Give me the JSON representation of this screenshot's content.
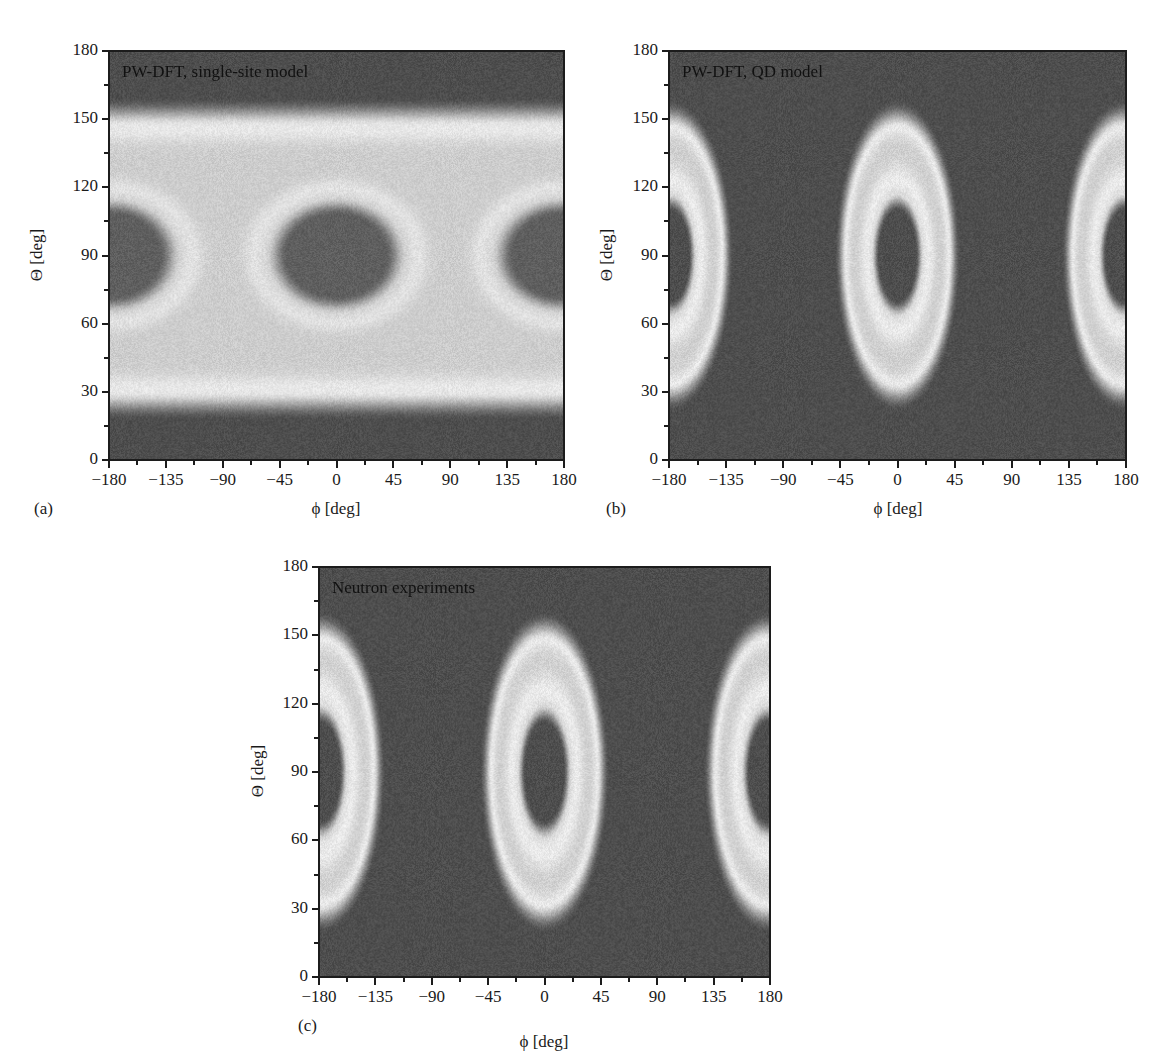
{
  "chart_data": [
    {
      "id": "a",
      "type": "heatmap",
      "panel_label": "(a)",
      "title": "PW-DFT, single-site model",
      "xlabel": "ϕ [deg]",
      "ylabel": "Θ [deg]",
      "xlim": [
        -180,
        180
      ],
      "ylim": [
        0,
        180
      ],
      "xticks": [
        "−180",
        "−135",
        "−90",
        "−45",
        "0",
        "45",
        "90",
        "135",
        "180"
      ],
      "yticks": [
        "0",
        "30",
        "60",
        "90",
        "120",
        "150",
        "180"
      ],
      "colormap": "grayscale",
      "description": "Bright horizontal band Θ≈25–155°, dark below ~20° and above ~160°; dark ellipses centered at (ϕ=0,Θ=90) and (ϕ=±180,Θ=90), half-width ~50° in ϕ, half-height ~25° in Θ; bright necks near ϕ=±90.",
      "features": {
        "band": {
          "theta_low": 25,
          "theta_high": 152
        },
        "dark_lobes": [
          {
            "phi": -180,
            "theta": 90,
            "rphi": 52,
            "rtheta": 24
          },
          {
            "phi": 0,
            "theta": 90,
            "rphi": 52,
            "rtheta": 24
          },
          {
            "phi": 180,
            "theta": 90,
            "rphi": 52,
            "rtheta": 24
          }
        ]
      }
    },
    {
      "id": "b",
      "type": "heatmap",
      "panel_label": "(b)",
      "title": "PW-DFT, QD model",
      "xlabel": "ϕ [deg]",
      "ylabel": "Θ [deg]",
      "xlim": [
        -180,
        180
      ],
      "ylim": [
        0,
        180
      ],
      "xticks": [
        "−180",
        "−135",
        "−90",
        "−45",
        "0",
        "45",
        "90",
        "135",
        "180"
      ],
      "yticks": [
        "0",
        "30",
        "60",
        "90",
        "120",
        "150",
        "180"
      ],
      "colormap": "grayscale",
      "description": "Bright elliptical rings centered at ϕ=0 and ϕ=±180, Θ=90; outer half-width ~45° in ϕ, outer half-height ~62° in Θ; dark inner core ~±17° ϕ, ±22° Θ; dark background elsewhere.",
      "features": {
        "rings": [
          {
            "phi": -180,
            "theta": 90,
            "outer_rphi": 46,
            "outer_rtheta": 64,
            "inner_rphi": 17,
            "inner_rtheta": 23
          },
          {
            "phi": 0,
            "theta": 90,
            "outer_rphi": 46,
            "outer_rtheta": 64,
            "inner_rphi": 17,
            "inner_rtheta": 23
          },
          {
            "phi": 180,
            "theta": 90,
            "outer_rphi": 46,
            "outer_rtheta": 64,
            "inner_rphi": 17,
            "inner_rtheta": 23
          }
        ]
      }
    },
    {
      "id": "c",
      "type": "heatmap",
      "panel_label": "(c)",
      "title": "Neutron experiments",
      "xlabel": "ϕ [deg]",
      "ylabel": "Θ [deg]",
      "xlim": [
        -180,
        180
      ],
      "ylim": [
        0,
        180
      ],
      "xticks": [
        "−180",
        "−135",
        "−90",
        "−45",
        "0",
        "45",
        "90",
        "135",
        "180"
      ],
      "yticks": [
        "0",
        "30",
        "60",
        "90",
        "120",
        "150",
        "180"
      ],
      "colormap": "grayscale",
      "description": "Same ring pattern as (b): bright elliptical rings at ϕ=0 and ±180 around Θ=90, outer half-width ~48° ϕ, ~66° Θ; dark inner core ~±18° ϕ, ±25° Θ.",
      "features": {
        "rings": [
          {
            "phi": -180,
            "theta": 90,
            "outer_rphi": 48,
            "outer_rtheta": 66,
            "inner_rphi": 18,
            "inner_rtheta": 25
          },
          {
            "phi": 0,
            "theta": 90,
            "outer_rphi": 48,
            "outer_rtheta": 66,
            "inner_rphi": 18,
            "inner_rtheta": 25
          },
          {
            "phi": 180,
            "theta": 90,
            "outer_rphi": 48,
            "outer_rtheta": 66,
            "inner_rphi": 18,
            "inner_rtheta": 25
          }
        ]
      }
    }
  ]
}
